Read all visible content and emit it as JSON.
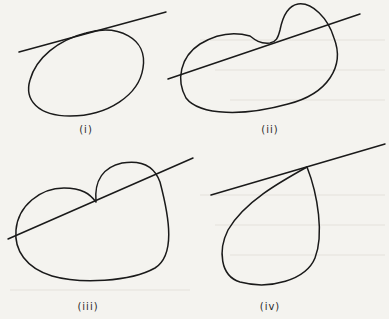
{
  "figure": {
    "panels": [
      {
        "id": "i",
        "label": "(i)",
        "description": "closed oval curve with a line tangent at its top"
      },
      {
        "id": "ii",
        "label": "(ii)",
        "description": "kidney-shaped curve with a bulge, line tangent to the concave dip and crossing the curve"
      },
      {
        "id": "iii",
        "label": "(iii)",
        "description": "heart-like curve with a cusp, line passing through the cusp"
      },
      {
        "id": "iv",
        "label": "(iv)",
        "description": "teardrop loop with a cusp lying on the line"
      }
    ]
  },
  "colors": {
    "ink": "#1a1a1a",
    "paper": "#f4f3ef"
  }
}
